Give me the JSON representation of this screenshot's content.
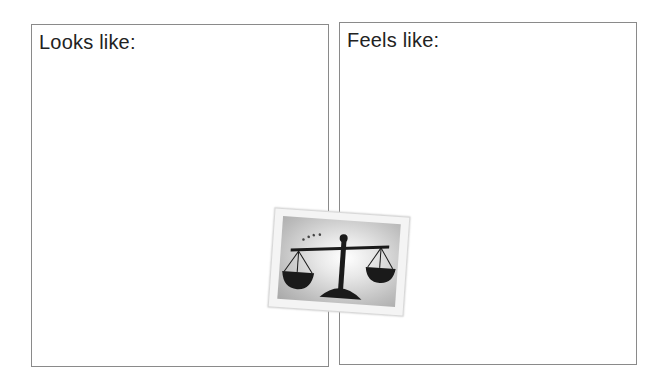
{
  "panels": {
    "left": {
      "title": "Looks like:"
    },
    "right": {
      "title": "Feels like:"
    }
  },
  "image": {
    "icon": "balance-scale-icon",
    "description": "scales of justice clip art",
    "colors": {
      "scale": "#1a1a1a",
      "background": "#bdbdbd",
      "frame": "#f4f4f4"
    }
  }
}
